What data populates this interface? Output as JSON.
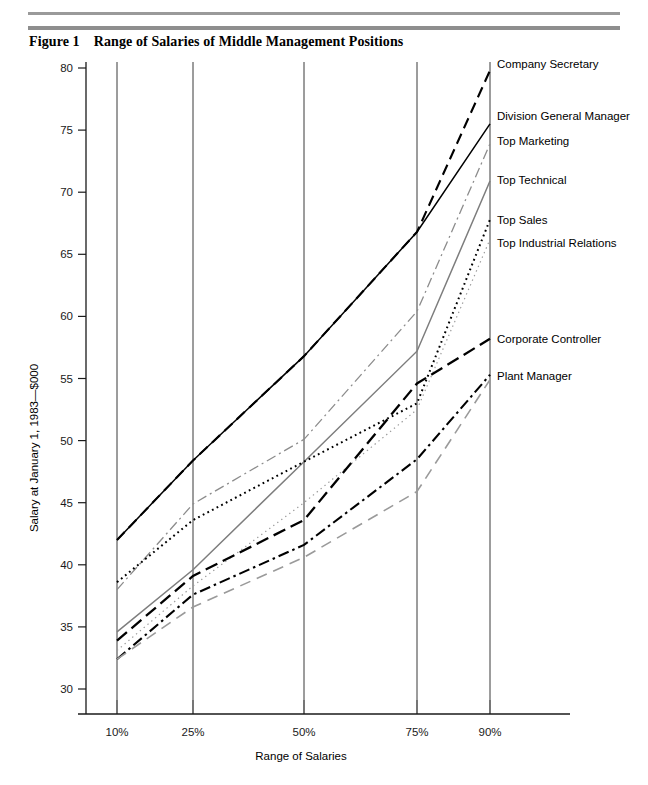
{
  "figure": {
    "number": "Figure 1",
    "title": "Range of Salaries of Middle Management Positions"
  },
  "chart_data": {
    "type": "line",
    "title": "Range of Salaries of Middle Management Positions",
    "xlabel": "Range of Salaries",
    "ylabel": "Salary at January 1, 1983—$000",
    "categories": [
      "10%",
      "25%",
      "50%",
      "75%",
      "90%"
    ],
    "x_tick_labels": [
      "10%",
      "25%",
      "50%",
      "75%",
      "90%"
    ],
    "y_tick_labels": [
      "30",
      "35",
      "40",
      "45",
      "50",
      "55",
      "60",
      "65",
      "70",
      "75",
      "80"
    ],
    "y_ticks": [
      30,
      35,
      40,
      45,
      50,
      55,
      60,
      65,
      70,
      75,
      80
    ],
    "ylim": [
      28.5,
      81
    ],
    "grid": "vertical-only",
    "legend_position": "right-inline-labels",
    "series": [
      {
        "name": "Company Secretary",
        "values": [
          42.0,
          48.4,
          56.8,
          66.8,
          79.8
        ],
        "style": "dashed",
        "color": "#000000",
        "label_y": 80.3
      },
      {
        "name": "Division General Manager",
        "values": [
          42.0,
          48.4,
          56.8,
          66.8,
          75.5
        ],
        "style": "solid",
        "color": "#000000",
        "label_y": 76.1
      },
      {
        "name": "Top Marketing",
        "values": [
          38.0,
          44.9,
          50.1,
          60.4,
          73.9
        ],
        "style": "dash-dot",
        "color": "#8c8c8c",
        "label_y": 74.1
      },
      {
        "name": "Top Technical",
        "values": [
          34.6,
          39.6,
          48.3,
          57.2,
          70.9
        ],
        "style": "solid",
        "color": "#7d7d7d",
        "label_y": 71.0
      },
      {
        "name": "Top Sales",
        "values": [
          38.6,
          43.6,
          48.3,
          53.0,
          67.8
        ],
        "style": "dotted",
        "color": "#000000",
        "label_y": 67.8
      },
      {
        "name": "Top Industrial Relations",
        "values": [
          33.1,
          38.3,
          45.0,
          52.5,
          66.2
        ],
        "style": "dotted-fine",
        "color": "#9b9b9b",
        "label_y": 65.9
      },
      {
        "name": "Corporate Controller",
        "values": [
          33.9,
          39.1,
          43.6,
          54.6,
          58.2
        ],
        "style": "long-dash",
        "color": "#000000",
        "label_y": 58.2
      },
      {
        "name": "Plant Manager",
        "values": [
          32.4,
          37.6,
          41.6,
          48.5,
          55.3
        ],
        "style": "dash-dot-black",
        "color": "#000000",
        "label_y": 55.2
      },
      {
        "name": "Plant Manager Lower",
        "values": [
          32.4,
          36.6,
          40.6,
          45.9,
          54.9
        ],
        "style": "dashed-gray",
        "color": "#9a9a9a",
        "label_y": null
      }
    ],
    "labels": [
      "Company Secretary",
      "Division General Manager",
      "Top Marketing",
      "Top Technical",
      "Top Sales",
      "Top Industrial Relations",
      "Corporate Controller",
      "Plant Manager"
    ]
  }
}
